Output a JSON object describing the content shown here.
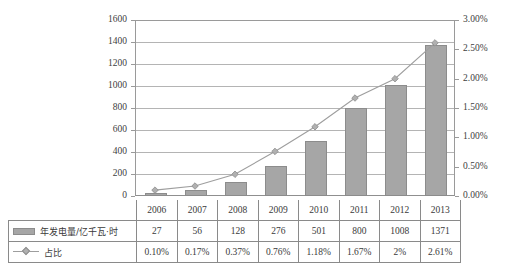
{
  "chart_data": {
    "type": "bar",
    "title": "",
    "xlabel": "",
    "ylabel": "",
    "grid": true,
    "legend_position": "table-below",
    "categories": [
      "2006",
      "2007",
      "2008",
      "2009",
      "2010",
      "2011",
      "2012",
      "2013"
    ],
    "series": [
      {
        "name": "年发电量/亿千瓦·时",
        "type": "bar",
        "axis": "left",
        "color": "#a6a6a6",
        "values": [
          27,
          56,
          128,
          276,
          501,
          800,
          1008,
          1371
        ],
        "value_labels": [
          "27",
          "56",
          "128",
          "276",
          "501",
          "800",
          "1008",
          "1371"
        ]
      },
      {
        "name": "占比",
        "type": "line",
        "axis": "right",
        "color": "#9e9e9e",
        "marker": "diamond",
        "values": [
          0.1,
          0.17,
          0.37,
          0.76,
          1.18,
          1.67,
          2.0,
          2.61
        ],
        "value_labels": [
          "0.10%",
          "0.17%",
          "0.37%",
          "0.76%",
          "1.18%",
          "1.67%",
          "2%",
          "2.61%"
        ]
      }
    ],
    "left_axis": {
      "min": 0,
      "max": 1600,
      "step": 200,
      "ticks": [
        "0",
        "200",
        "400",
        "600",
        "800",
        "1000",
        "1200",
        "1400",
        "1600"
      ]
    },
    "right_axis": {
      "min": 0,
      "max": 3.0,
      "step": 0.5,
      "ticks": [
        "0.00%",
        "0.50%",
        "1.00%",
        "1.50%",
        "2.00%",
        "2.50%",
        "3.00%"
      ]
    }
  },
  "table": {
    "header_row": [
      "2006",
      "2007",
      "2008",
      "2009",
      "2010",
      "2011",
      "2012",
      "2013"
    ],
    "rows": [
      {
        "label": "年发电量/亿千瓦·时",
        "legend_icon": "bar-swatch-icon",
        "cells": [
          "27",
          "56",
          "128",
          "276",
          "501",
          "800",
          "1008",
          "1371"
        ]
      },
      {
        "label": "占比",
        "legend_icon": "line-marker-swatch-icon",
        "cells": [
          "0.10%",
          "0.17%",
          "0.37%",
          "0.76%",
          "1.18%",
          "1.67%",
          "2%",
          "2.61%"
        ]
      }
    ]
  }
}
